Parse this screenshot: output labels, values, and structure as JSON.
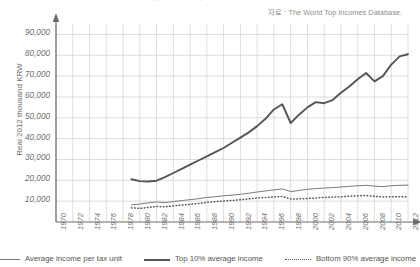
{
  "chart_data": {
    "type": "line",
    "title": "Average income, Korea 1970-2012",
    "source_note": "자료 : The World Top Incomes Database.",
    "xlabel": "",
    "ylabel": "Real 2012 thousand KRW",
    "ylim": [
      0,
      95000
    ],
    "xlim": [
      1970,
      2012
    ],
    "grid": true,
    "legend_position": "bottom",
    "ytick_labels": [
      "90,000",
      "80,000",
      "70,000",
      "60,000",
      "50,000",
      "40,000",
      "30,000",
      "20,000",
      "10,000"
    ],
    "ytick_values": [
      90000,
      80000,
      70000,
      60000,
      50000,
      40000,
      30000,
      20000,
      10000
    ],
    "xtick_labels": [
      "1970",
      "1972",
      "1974",
      "1976",
      "1978",
      "1980",
      "1982",
      "1984",
      "1986",
      "1988",
      "1990",
      "1992",
      "1994",
      "1996",
      "1998",
      "2000",
      "2002",
      "2004",
      "2006",
      "2008",
      "2010",
      "2012"
    ],
    "x": [
      1970,
      1971,
      1972,
      1973,
      1974,
      1975,
      1976,
      1977,
      1978,
      1979,
      1980,
      1981,
      1982,
      1983,
      1984,
      1985,
      1986,
      1987,
      1988,
      1989,
      1990,
      1991,
      1992,
      1993,
      1994,
      1995,
      1996,
      1997,
      1998,
      1999,
      2000,
      2001,
      2002,
      2003,
      2004,
      2005,
      2006,
      2007,
      2008,
      2009,
      2010,
      2011,
      2012
    ],
    "series": [
      {
        "name": "Average income per tax unit",
        "style": "thin-solid",
        "color": "#7a7a7a",
        "x": [
          1979,
          1980,
          1981,
          1982,
          1983,
          1984,
          1985,
          1986,
          1987,
          1988,
          1989,
          1990,
          1991,
          1992,
          1993,
          1994,
          1995,
          1996,
          1997,
          1998,
          1999,
          2000,
          2001,
          2002,
          2003,
          2004,
          2005,
          2006,
          2007,
          2008,
          2009,
          2010,
          2011,
          2012
        ],
        "values": [
          8200,
          8600,
          9200,
          9600,
          9300,
          9800,
          10300,
          10700,
          11200,
          11800,
          12100,
          12600,
          12900,
          13300,
          13800,
          14400,
          14900,
          15400,
          15900,
          14600,
          15100,
          15700,
          16000,
          16300,
          16500,
          16800,
          17100,
          17400,
          17600,
          17200,
          17000,
          17400,
          17600,
          17700
        ]
      },
      {
        "name": "Top 10% average income",
        "style": "thick-solid",
        "color": "#555555",
        "x": [
          1979,
          1980,
          1981,
          1982,
          1983,
          1984,
          1985,
          1986,
          1987,
          1988,
          1989,
          1990,
          1991,
          1992,
          1993,
          1994,
          1995,
          1996,
          1997,
          1998,
          1999,
          2000,
          2001,
          2002,
          2003,
          2004,
          2005,
          2006,
          2007,
          2008,
          2009,
          2010,
          2011,
          2012
        ],
        "values": [
          20500,
          19600,
          19400,
          19800,
          21500,
          23500,
          25500,
          27500,
          29500,
          31500,
          33500,
          35500,
          38000,
          40500,
          43000,
          46000,
          49500,
          54000,
          56500,
          47500,
          51500,
          55000,
          57500,
          57000,
          58500,
          62000,
          65000,
          68500,
          71500,
          67500,
          70000,
          75500,
          79500,
          80500
        ]
      },
      {
        "name": "Bottom 90% average income",
        "style": "dotted",
        "color": "#555555",
        "x": [
          1979,
          1980,
          1981,
          1982,
          1983,
          1984,
          1985,
          1986,
          1987,
          1988,
          1989,
          1990,
          1991,
          1992,
          1993,
          1994,
          1995,
          1996,
          1997,
          1998,
          1999,
          2000,
          2001,
          2002,
          2003,
          2004,
          2005,
          2006,
          2007,
          2008,
          2009,
          2010,
          2011,
          2012
        ],
        "values": [
          6800,
          6500,
          7000,
          7400,
          7300,
          7700,
          8100,
          8500,
          8900,
          9400,
          9700,
          10100,
          10300,
          10700,
          11100,
          11500,
          11800,
          12000,
          12300,
          11000,
          11100,
          11300,
          11500,
          11800,
          11900,
          12100,
          12400,
          12600,
          12700,
          12300,
          12000,
          12100,
          12100,
          12000
        ]
      }
    ]
  }
}
